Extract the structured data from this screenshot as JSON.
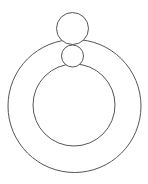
{
  "diagram": {
    "width": 148,
    "height": 184,
    "background": "#ffffff",
    "stroke_color": "#555555",
    "stroke_width": 1,
    "shapes": [
      {
        "name": "outer-ring-circle",
        "cx": 74.5,
        "cy": 106,
        "r": 66.5
      },
      {
        "name": "inner-ring-circle",
        "cx": 74,
        "cy": 105,
        "r": 41
      },
      {
        "name": "top-large-circle",
        "cx": 72.5,
        "cy": 28.5,
        "r": 16
      },
      {
        "name": "top-small-circle",
        "cx": 72.5,
        "cy": 56,
        "r": 11
      }
    ]
  }
}
